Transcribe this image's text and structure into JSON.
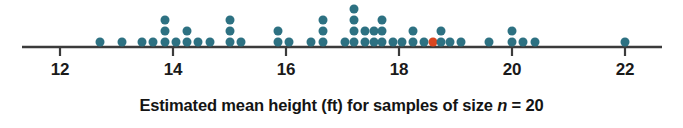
{
  "chart_data": {
    "type": "dotplot",
    "title": "",
    "xlabel_parts": {
      "before": "Estimated mean height (ft) for samples of size ",
      "italic": "n",
      "after": " = 20"
    },
    "xlabel": "Estimated mean height (ft) for samples of size n = 20",
    "ylabel": "",
    "xlim": [
      11.4,
      22.5
    ],
    "ylim": [
      0,
      6
    ],
    "grid": false,
    "legend": "none",
    "axis_line_color": "#3b3b3b",
    "dot_color": "#2d7182",
    "highlight_color": "#d9461f",
    "x_ticks": [
      12,
      14,
      16,
      18,
      20,
      22
    ],
    "x_tick_labels": [
      "12",
      "14",
      "16",
      "18",
      "20",
      "22"
    ],
    "bin_width": 0.2,
    "highlight_value": 18.6,
    "highlight_note": "single red dot marking one sample mean",
    "stacks": [
      {
        "value": 12.7,
        "count": 1
      },
      {
        "value": 13.1,
        "count": 1
      },
      {
        "value": 13.45,
        "count": 1
      },
      {
        "value": 13.65,
        "count": 1
      },
      {
        "value": 13.85,
        "count": 3
      },
      {
        "value": 14.05,
        "count": 1
      },
      {
        "value": 14.25,
        "count": 2
      },
      {
        "value": 14.45,
        "count": 1
      },
      {
        "value": 14.65,
        "count": 1
      },
      {
        "value": 15.0,
        "count": 3
      },
      {
        "value": 15.2,
        "count": 1
      },
      {
        "value": 15.85,
        "count": 2
      },
      {
        "value": 16.05,
        "count": 1
      },
      {
        "value": 16.45,
        "count": 1
      },
      {
        "value": 16.65,
        "count": 3
      },
      {
        "value": 17.05,
        "count": 1
      },
      {
        "value": 17.2,
        "count": 4
      },
      {
        "value": 17.4,
        "count": 2
      },
      {
        "value": 17.55,
        "count": 2
      },
      {
        "value": 17.7,
        "count": 3
      },
      {
        "value": 17.9,
        "count": 1
      },
      {
        "value": 18.05,
        "count": 1
      },
      {
        "value": 18.25,
        "count": 2
      },
      {
        "value": 18.45,
        "count": 1
      },
      {
        "value": 18.6,
        "count": 1,
        "highlight": true
      },
      {
        "value": 18.75,
        "count": 2
      },
      {
        "value": 18.9,
        "count": 1
      },
      {
        "value": 19.1,
        "count": 1
      },
      {
        "value": 19.6,
        "count": 1
      },
      {
        "value": 20.0,
        "count": 2
      },
      {
        "value": 20.2,
        "count": 1
      },
      {
        "value": 20.4,
        "count": 1
      },
      {
        "value": 22.0,
        "count": 1
      }
    ],
    "total_dots": 57
  },
  "layout": {
    "axis_y": 47,
    "axis_x_start": 22,
    "axis_x_end": 662,
    "tick_height": 9,
    "dot_diameter": 9,
    "dot_pitch_y": 11,
    "first_dot_center_y": 42,
    "pixels_per_unit": 56.5,
    "x_origin_px": 60,
    "x_origin_value": 12
  }
}
